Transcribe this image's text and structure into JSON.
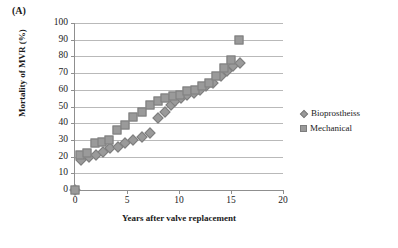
{
  "figure": {
    "panel_label": "(A)"
  },
  "chart_data": {
    "type": "scatter",
    "title": "",
    "xlabel": "Years after valve replacement",
    "ylabel": "Mortality of MVR (%)",
    "xlim": [
      0,
      20
    ],
    "ylim": [
      0,
      100
    ],
    "xticks": [
      0,
      5,
      10,
      15,
      20
    ],
    "yticks": [
      0,
      10,
      20,
      30,
      40,
      50,
      60,
      70,
      80,
      90,
      100
    ],
    "xtick_labels": [
      "0",
      "5",
      "10",
      "15",
      "20"
    ],
    "ytick_labels": [
      "0",
      "10",
      "20",
      "30",
      "40",
      "50",
      "60",
      "70",
      "80",
      "90",
      "100"
    ],
    "grid": "horizontal",
    "legend_position": "right",
    "colors": {
      "marker_fill": "#9a9a9a",
      "marker_edge": "#7d7d7d",
      "gridline": "#b9b9b9",
      "axis": "#8f8f8f"
    },
    "series": [
      {
        "name": "Bioprostheiss",
        "marker": "diamond",
        "x": [
          0,
          0.6,
          1.3,
          2.0,
          2.7,
          3.4,
          4.1,
          4.8,
          5.6,
          6.4,
          7.2,
          8.0,
          8.7,
          9.2,
          9.6,
          10.2,
          10.8,
          11.4,
          12.0,
          12.6,
          13.3,
          14.0,
          14.6,
          15.2,
          15.9
        ],
        "y": [
          0,
          18,
          20,
          21,
          23,
          25,
          26,
          28,
          30,
          32,
          34,
          43,
          47,
          51,
          53,
          55,
          57,
          58,
          60,
          62,
          64,
          68,
          71,
          74,
          76
        ]
      },
      {
        "name": "Mechanical",
        "marker": "square",
        "x": [
          0,
          0.5,
          1.2,
          1.9,
          2.6,
          3.3,
          4.0,
          4.8,
          5.6,
          6.4,
          7.2,
          8.0,
          8.7,
          9.4,
          10.1,
          10.8,
          11.5,
          12.2,
          12.9,
          13.6,
          14.3,
          15.0,
          15.8
        ],
        "y": [
          0,
          21,
          22,
          28,
          29,
          30,
          36,
          39,
          44,
          47,
          51,
          53,
          55,
          56,
          57,
          59,
          60,
          62,
          64,
          68,
          73,
          78,
          90
        ]
      }
    ]
  },
  "legend": {
    "items": [
      {
        "label": "Bioprostheiss",
        "marker": "diamond"
      },
      {
        "label": "Mechanical",
        "marker": "square"
      }
    ]
  }
}
